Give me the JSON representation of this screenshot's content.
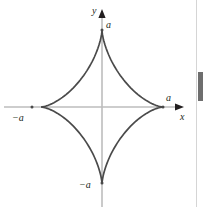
{
  "figure": {
    "kind": "astroid-plot",
    "background_color": "#ffffff",
    "curve_color": "#4a4a4a",
    "axis_color": "#bdbdbd",
    "arrow_color": "#231f20",
    "label_color": "#231f20"
  },
  "axes": {
    "y_axis_label": "y",
    "x_axis_label": "x",
    "origin_px": {
      "x": 102,
      "y": 107
    },
    "x_axis_y_px": 107,
    "y_axis_x_px": 102
  },
  "labels": {
    "a_top": "a",
    "a_right": "a",
    "neg_a_left": "−a",
    "neg_a_bottom": "−a"
  },
  "scrollbar": {
    "thumb_top_px": 72,
    "thumb_height_px": 29,
    "track_color": "#ffffff",
    "thumb_color": "#6e6e6e"
  },
  "chart_data": {
    "type": "line",
    "title": "",
    "xlabel": "x",
    "ylabel": "y",
    "equation": "x^(2/3) + y^(2/3) = a^(2/3)",
    "curve_name": "astroid",
    "parametric": "x = a cos^3(t), y = a sin^3(t)",
    "grid": false,
    "legend": null,
    "xlim": [
      -1.35,
      1.35
    ],
    "ylim": [
      -1.35,
      1.35
    ],
    "xticks": [
      -1,
      1
    ],
    "xticklabels": [
      "−a",
      "a"
    ],
    "yticks": [
      -1,
      1
    ],
    "yticklabels": [
      "−a",
      "a"
    ],
    "cusps": [
      {
        "label": "a",
        "x": 1,
        "y": 0
      },
      {
        "label": "−a",
        "x": -1,
        "y": 0
      },
      {
        "label": "a",
        "x": 0,
        "y": 1
      },
      {
        "label": "−a",
        "x": 0,
        "y": -1
      }
    ],
    "annotations": [
      {
        "text": "a",
        "x": 0,
        "y": 1,
        "position": "right-of-top-cusp"
      },
      {
        "text": "a",
        "x": 1,
        "y": 0,
        "position": "above-right-cusp"
      },
      {
        "text": "−a",
        "x": -1,
        "y": 0,
        "position": "below-left-cusp"
      },
      {
        "text": "−a",
        "x": 0,
        "y": -1,
        "position": "left-of-bottom-cusp"
      },
      {
        "text": "y",
        "position": "top-of-y-axis"
      },
      {
        "text": "x",
        "position": "right-of-x-axis"
      }
    ]
  }
}
